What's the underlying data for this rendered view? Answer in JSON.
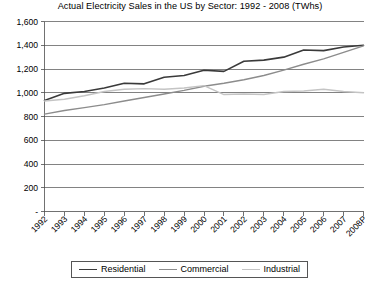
{
  "chart_data": {
    "type": "line",
    "title": "Actual Electricity Sales in the US by Sector: 1992 - 2008 (TWhs)",
    "xlabel": "",
    "ylabel": "",
    "ylim": [
      0,
      1600
    ],
    "ytick_labels": [
      "1,600",
      "1,400",
      "1,200",
      "1,000",
      "800",
      "600",
      "400",
      "200",
      "-"
    ],
    "ytick_values": [
      1600,
      1400,
      1200,
      1000,
      800,
      600,
      400,
      200,
      0
    ],
    "grid": true,
    "legend_position": "bottom",
    "categories": [
      "1992",
      "1993",
      "1994",
      "1995",
      "1996",
      "1997",
      "1998",
      "1999",
      "2000",
      "2001",
      "2002",
      "2003",
      "2004",
      "2005",
      "2006",
      "2007",
      "2008P"
    ],
    "series": [
      {
        "name": "Residential",
        "color": "#3a3a3a",
        "width": 1.6,
        "values": [
          935,
          995,
          1010,
          1040,
          1080,
          1075,
          1130,
          1145,
          1190,
          1180,
          1265,
          1275,
          1300,
          1360,
          1355,
          1385,
          1400
        ]
      },
      {
        "name": "Commercial",
        "color": "#8c8c8c",
        "width": 1.4,
        "values": [
          820,
          850,
          875,
          900,
          930,
          960,
          990,
          1020,
          1055,
          1080,
          1110,
          1145,
          1190,
          1240,
          1285,
          1340,
          1395
        ]
      },
      {
        "name": "Industrial",
        "color": "#c4c4c4",
        "width": 1.4,
        "values": [
          930,
          945,
          975,
          1010,
          1030,
          1035,
          1030,
          1040,
          1060,
          985,
          990,
          985,
          1010,
          1015,
          1030,
          1010,
          1000
        ]
      }
    ]
  },
  "legend": {
    "entries": [
      {
        "label": "Residential"
      },
      {
        "label": "Commercial"
      },
      {
        "label": "Industrial"
      }
    ]
  }
}
